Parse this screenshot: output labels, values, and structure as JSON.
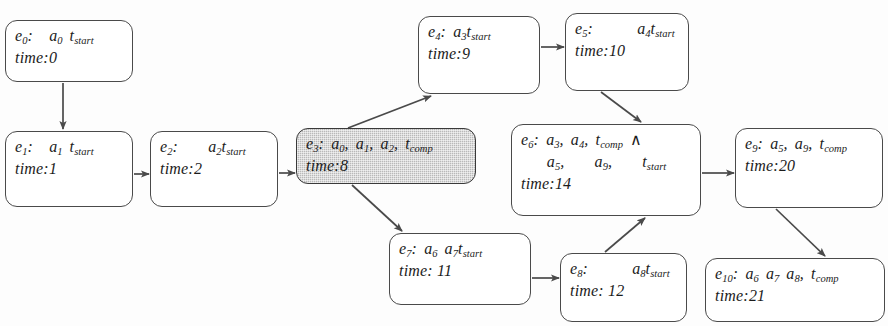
{
  "diagram": {
    "style": {
      "node_fill": "#ffffff",
      "node_fill_highlight": "#b9b9b9",
      "border": "#4a4a4a",
      "text": "#1c1c1c",
      "background": "#fdfdfd"
    },
    "nodes": [
      {
        "id": "e0",
        "label": "e",
        "index": "0",
        "sep": ":",
        "actions": "a",
        "action_index": "0",
        "term": "t",
        "term_sub": "start",
        "time_label": "time:",
        "time_value": "0",
        "highlight": false
      },
      {
        "id": "e1",
        "label": "e",
        "index": "1",
        "sep": ":",
        "actions": "a",
        "action_index": "1",
        "term": "t",
        "term_sub": "start",
        "time_label": "time:",
        "time_value": "1",
        "highlight": false
      },
      {
        "id": "e2",
        "label": "e",
        "index": "2",
        "sep": ":",
        "actions": "a",
        "action_index": "2",
        "term": "t",
        "term_sub": "start",
        "time_label": "time:",
        "time_value": "2",
        "highlight": false
      },
      {
        "id": "e3",
        "label": "e",
        "index": "3",
        "sep": ":",
        "actions": "a",
        "action_index": "0",
        "action_index2": "1",
        "action_index3": "2",
        "term": "t",
        "term_sub": "comp",
        "time_label": "time:",
        "time_value": "8",
        "highlight": true
      },
      {
        "id": "e4",
        "label": "e",
        "index": "4",
        "sep": ":",
        "actions": "a",
        "action_index": "3",
        "term": "t",
        "term_sub": "start",
        "time_label": "time:",
        "time_value": "9",
        "highlight": false
      },
      {
        "id": "e5",
        "label": "e",
        "index": "5",
        "sep": ":",
        "actions": "a",
        "action_index": "4",
        "term": "t",
        "term_sub": "start",
        "time_label": "time:",
        "time_value": "10",
        "highlight": false
      },
      {
        "id": "e6",
        "label": "e",
        "index": "6",
        "sep": ":",
        "actions": "a",
        "action_index": "3",
        "action_index2": "4",
        "term": "t",
        "term_sub": "comp",
        "conjunction": "∧",
        "action_index3": "5",
        "action_index4": "9",
        "term2": "t",
        "term2_sub": "start",
        "time_label": "time:",
        "time_value": "14",
        "highlight": false
      },
      {
        "id": "e7",
        "label": "e",
        "index": "7",
        "sep": ":",
        "actions": "a",
        "action_index": "6",
        "action_index2": "7",
        "term": "t",
        "term_sub": "start",
        "time_label": "time: ",
        "time_value": "11",
        "highlight": false
      },
      {
        "id": "e8",
        "label": "e",
        "index": "8",
        "sep": ":",
        "actions": "a",
        "action_index": "8",
        "term": "t",
        "term_sub": "start",
        "time_label": "time: ",
        "time_value": "12",
        "highlight": false
      },
      {
        "id": "e9",
        "label": "e",
        "index": "9",
        "sep": ":",
        "actions": "a",
        "action_index": "5",
        "action_index2": "9",
        "term": "t",
        "term_sub": "comp",
        "time_label": "time:",
        "time_value": "20",
        "highlight": false
      },
      {
        "id": "e10",
        "label": "e",
        "index": "10",
        "sep": ":",
        "actions": "a",
        "action_index": "6",
        "action_index2": "7",
        "action_index3": "8",
        "term": "t",
        "term_sub": "comp",
        "time_label": "time:",
        "time_value": "21",
        "highlight": false
      }
    ],
    "edges": [
      {
        "from": "e0",
        "to": "e1"
      },
      {
        "from": "e1",
        "to": "e2"
      },
      {
        "from": "e2",
        "to": "e3"
      },
      {
        "from": "e3",
        "to": "e4"
      },
      {
        "from": "e3",
        "to": "e7"
      },
      {
        "from": "e4",
        "to": "e5"
      },
      {
        "from": "e5",
        "to": "e6"
      },
      {
        "from": "e6",
        "to": "e9"
      },
      {
        "from": "e7",
        "to": "e8"
      },
      {
        "from": "e8",
        "to": "e6"
      },
      {
        "from": "e9",
        "to": "e10"
      }
    ]
  }
}
